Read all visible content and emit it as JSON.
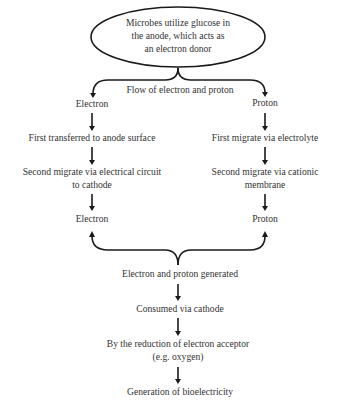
{
  "start_node": {
    "lines": [
      "Microbes utilize glucose in",
      "the anode, which acts as",
      "an electron donor"
    ]
  },
  "split_label": "Flow of electron and proton",
  "electron_branch": {
    "head": "Electron",
    "step1": "First transferred to anode surface",
    "step2": [
      "Second migrate via electrical circuit",
      "to cathode"
    ],
    "tail": "Electron"
  },
  "proton_branch": {
    "head": "Proton",
    "step1": "First migrate via electrolyte",
    "step2": [
      "Second migrate via cationic",
      "membrane"
    ],
    "tail": "Proton"
  },
  "merge_steps": {
    "generated": "Electron and proton generated",
    "consumed": "Consumed via cathode",
    "reduction": [
      "By the reduction of electron acceptor",
      "(e.g. oxygen)"
    ],
    "result": "Generation of bioelectricity"
  },
  "colors": {
    "stroke": "#1a1a1a",
    "text": "#333333"
  }
}
